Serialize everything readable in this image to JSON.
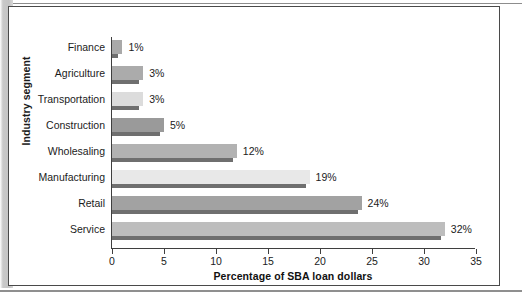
{
  "figure": {
    "y_axis_title": "Industry segment",
    "x_axis_title": "Percentage of SBA loan dollars"
  },
  "chart_data": {
    "type": "bar",
    "orientation": "horizontal",
    "title": "",
    "xlabel": "Percentage of SBA loan dollars",
    "ylabel": "Industry segment",
    "xlim": [
      0,
      35
    ],
    "xticks": [
      0,
      5,
      10,
      15,
      20,
      25,
      30,
      35
    ],
    "grid": false,
    "legend": "none",
    "categories": [
      "Finance",
      "Agriculture",
      "Transportation",
      "Construction",
      "Wholesaling",
      "Manufacturing",
      "Retail",
      "Service"
    ],
    "values": [
      1,
      3,
      3,
      5,
      12,
      19,
      24,
      32
    ],
    "data_labels": [
      "1%",
      "3%",
      "3%",
      "5%",
      "12%",
      "19%",
      "24%",
      "32%"
    ],
    "bar_colors": [
      "#a9a9a9",
      "#ababab",
      "#dcdcdc",
      "#9a9a9a",
      "#b2b2b2",
      "#e8e8e8",
      "#a2a2a2",
      "#bdbdbd"
    ],
    "bar_shadow_color": "#6f6f6f"
  }
}
